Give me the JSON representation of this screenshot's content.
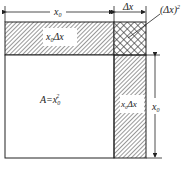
{
  "diagram": {
    "top_dimension_x0": "x",
    "top_dimension_x0_sub": "0",
    "top_dimension_dx": "Δx",
    "label_dx2": "(Δx)",
    "label_dx2_sup": "2",
    "top_strip_label": "x",
    "top_strip_label_sub": "0",
    "top_strip_label_rest": "Δx",
    "right_strip_label": "x",
    "right_strip_label_sub": "0",
    "right_strip_label_rest": "Δx",
    "area_label": "A=x",
    "area_label_sub": "0",
    "area_label_sup": "2",
    "right_dimension_x0": "x",
    "right_dimension_x0_sub": "0"
  }
}
